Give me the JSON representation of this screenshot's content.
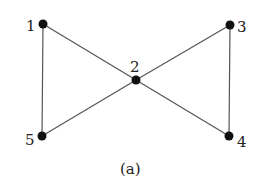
{
  "diagram": {
    "caption": "(a)",
    "nodes": [
      {
        "id": "1",
        "label": "1",
        "x": 43,
        "y": 24
      },
      {
        "id": "2",
        "label": "2",
        "x": 136,
        "y": 80
      },
      {
        "id": "3",
        "label": "3",
        "x": 230,
        "y": 25
      },
      {
        "id": "4",
        "label": "4",
        "x": 229,
        "y": 136
      },
      {
        "id": "5",
        "label": "5",
        "x": 42,
        "y": 136
      }
    ],
    "edges": [
      [
        "1",
        "2"
      ],
      [
        "1",
        "5"
      ],
      [
        "5",
        "2"
      ],
      [
        "2",
        "3"
      ],
      [
        "2",
        "4"
      ],
      [
        "3",
        "4"
      ]
    ],
    "colors": {
      "edge": "#555555",
      "node": "#111111"
    }
  }
}
